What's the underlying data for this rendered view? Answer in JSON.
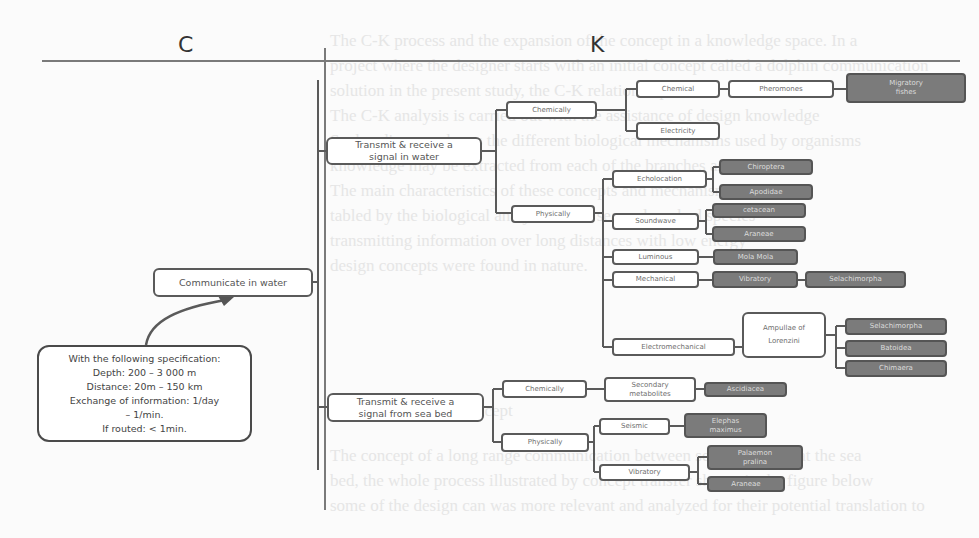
{
  "headers": {
    "left": "C",
    "right": "K"
  },
  "concept": {
    "root": "Communicate in water",
    "specification": {
      "title": "With the following specification:",
      "lines": [
        "Depth: 200 – 3 000 m",
        "Distance: 20m – 150 km",
        "Exchange of information: 1/day",
        "– 1/min.",
        "If routed: < 1min."
      ]
    }
  },
  "knowledge": {
    "water": {
      "label": "Transmit & receive a signal in water",
      "chemically": {
        "label": "Chemically",
        "chemical": "Chemical",
        "pheromones": "Pheromones",
        "migratory_fishes": "Migratory fishes",
        "electricity": "Electricity"
      },
      "physically": {
        "label": "Physically",
        "echolocation": "Echolocation",
        "chiroptera": "Chiroptera",
        "apodidae": "Apodidae",
        "soundwave": "Soundwave",
        "cetacean": "cetacean",
        "araneae": "Araneae",
        "luminous": "Luminous",
        "mola_mola": "Mola Mola",
        "mechanical": "Mechanical",
        "vibratory": "Vibratory",
        "selachimorpha_mech": "Selachimorpha",
        "electromechanical": "Electromechanical",
        "ampullae": "Ampullae of Lorenzini",
        "selachimorpha": "Selachimorpha",
        "batoidea": "Batoidea",
        "chimaera": "Chimaera"
      }
    },
    "seabed": {
      "label": "Transmit & receive a signal from sea bed",
      "chemically": {
        "label": "Chemically",
        "secondary_metabolites": "Secondary metabolites",
        "ascidiacea": "Ascidiacea"
      },
      "physically": {
        "label": "Physically",
        "seismic": "Seismic",
        "elephas_maximus": "Elephas maximus",
        "vibratory": "Vibratory",
        "palaemon_pralina": "Palaemon pralina",
        "araneae": "Araneae"
      }
    }
  },
  "colors": {
    "line": "#5a5a5a",
    "dark_box": "#7b7b7b",
    "background": "#fbfbfb"
  }
}
